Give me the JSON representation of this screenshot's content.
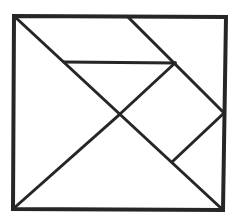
{
  "diagram": {
    "stroke_color": "#262626",
    "background": "#ffffff",
    "outer_square": {
      "points": "14,16 226,17 223,210 13,209",
      "stroke_width": 4
    },
    "lines": [
      {
        "id": "diag-tl-br",
        "x1": 14,
        "y1": 16,
        "x2": 223,
        "y2": 210,
        "w": 3
      },
      {
        "id": "diag-bl-center",
        "x1": 13,
        "y1": 209,
        "x2": 120,
        "y2": 114,
        "w": 3
      },
      {
        "id": "top-diag",
        "x1": 128,
        "y1": 17,
        "x2": 224,
        "y2": 113,
        "w": 3
      },
      {
        "id": "horizontal",
        "x1": 65,
        "y1": 62,
        "x2": 175,
        "y2": 63,
        "w": 3
      },
      {
        "id": "mid-diag",
        "x1": 175,
        "y1": 63,
        "x2": 120,
        "y2": 114,
        "w": 3
      },
      {
        "id": "right-diag",
        "x1": 224,
        "y1": 113,
        "x2": 172,
        "y2": 162,
        "w": 3
      }
    ],
    "pieces": [
      "large-triangle-left",
      "large-triangle-bottom",
      "medium-triangle-top",
      "small-triangle-center",
      "small-triangle-right",
      "square",
      "parallelogram"
    ]
  }
}
